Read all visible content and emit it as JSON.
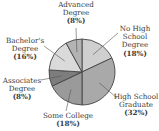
{
  "chart_data": {
    "type": "pie",
    "title": "",
    "start_angle_deg": 0,
    "direction": "clockwise",
    "slices": [
      {
        "label": "No High School Degree",
        "value": 18,
        "display": "(18%)",
        "color": "#cfcfcf"
      },
      {
        "label": "High School Graduate",
        "value": 32,
        "display": "(32%)",
        "color": "#a9a9a9"
      },
      {
        "label": "Some College",
        "value": 18,
        "display": "(18%)",
        "color": "#9a9a9a"
      },
      {
        "label": "Associates Degree",
        "value": 8,
        "display": "(8%)",
        "color": "#7d7d7d"
      },
      {
        "label": "Bachelor's Degree",
        "value": 16,
        "display": "(16%)",
        "color": "#dadada"
      },
      {
        "label": "Advanced Degree",
        "value": 8,
        "display": "(8%)",
        "color": "#b3b3b3"
      }
    ],
    "categories": [
      "No High School Degree",
      "High School Graduate",
      "Some College",
      "Associates Degree",
      "Bachelor's Degree",
      "Advanced Degree"
    ],
    "values": [
      18,
      32,
      18,
      8,
      16,
      8
    ],
    "legend": "none (callout labels)"
  },
  "labels": {
    "no_high_school": {
      "line1": "No High",
      "line2": "School",
      "line3": "Degree",
      "pct": "(18%)"
    },
    "high_school": {
      "line1": "High School",
      "line2": "Graduate",
      "pct": "(32%)"
    },
    "some_college": {
      "line1": "Some College",
      "pct": "(18%)"
    },
    "associates": {
      "line1": "Associates",
      "line2": "Degree",
      "pct": "(8%)"
    },
    "bachelors": {
      "line1": "Bachelor's",
      "line2": "Degree",
      "pct": "(16%)"
    },
    "advanced": {
      "line1": "Advanced",
      "line2": "Degree",
      "pct": "(8%)"
    }
  },
  "style": {
    "stroke": "#444444",
    "leader_color": "#555555"
  }
}
